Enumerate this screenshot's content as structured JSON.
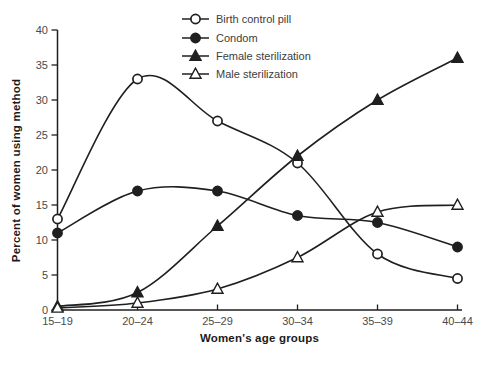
{
  "figure": {
    "background": "#ffffff"
  },
  "chart_data": {
    "type": "line",
    "categories": [
      "15–19",
      "20–24",
      "25–29",
      "30–34",
      "35–39",
      "40–44"
    ],
    "series": [
      {
        "name": "Birth control pill",
        "marker": "open-circle",
        "values": [
          13,
          33,
          27,
          21,
          8,
          4.5
        ]
      },
      {
        "name": "Condom",
        "marker": "filled-circle",
        "values": [
          11,
          17,
          17,
          13.5,
          12.5,
          9
        ]
      },
      {
        "name": "Female sterilization",
        "marker": "filled-triangle",
        "values": [
          0.5,
          2.5,
          12,
          22,
          30,
          36
        ]
      },
      {
        "name": "Male sterilization",
        "marker": "open-triangle",
        "values": [
          0.3,
          1,
          3,
          7.5,
          14,
          15
        ]
      }
    ],
    "xlabel": "Women's age groups",
    "ylabel": "Percent of women using method",
    "ylim": [
      0,
      40
    ],
    "yticks": [
      0,
      5,
      10,
      15,
      20,
      25,
      30,
      35,
      40
    ],
    "grid": false,
    "legend_position": "top-center-inside",
    "colors": {
      "ink": "#1f1f1f",
      "tick_label": "#4a4a4a",
      "legend_label": "#3d3d3d"
    }
  }
}
